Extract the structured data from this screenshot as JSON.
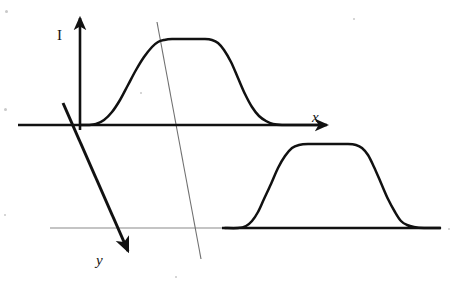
{
  "figure": {
    "background_color": "#ffffff",
    "stroke_color": "#111111",
    "thin_line_color": "#8a8a8a",
    "width": 456,
    "height": 292,
    "labels": {
      "vertical_axis": "I",
      "horizontal_axis": "x",
      "oblique_axis": "y"
    }
  },
  "chart_data": {
    "type": "line",
    "title": "",
    "xlabel": "x",
    "ylabel": "I",
    "grid": false,
    "legend": null,
    "annotations": [
      {
        "name": "vertical-axis-label",
        "text": "I",
        "x": 63,
        "y": 35
      },
      {
        "name": "horizontal-axis-label",
        "text": "x",
        "x": 317,
        "y": 117
      },
      {
        "name": "oblique-axis-label",
        "text": "y",
        "x": 101,
        "y": 261
      }
    ],
    "axes": [
      {
        "name": "vertical-axis-I",
        "label": "I",
        "from": [
          80,
          130
        ],
        "to": [
          80,
          12
        ],
        "arrow": "end",
        "weight": "thick"
      },
      {
        "name": "horizontal-axis-x",
        "label": "x",
        "from": [
          18,
          125
        ],
        "to": [
          332,
          125
        ],
        "arrow": "end",
        "weight": "thick"
      },
      {
        "name": "oblique-axis-y",
        "label": "y",
        "from": [
          63,
          103
        ],
        "to": [
          131,
          258
        ],
        "arrow": "end",
        "weight": "thick"
      },
      {
        "name": "secondary-baseline",
        "label": "",
        "from": [
          50,
          228
        ],
        "to": [
          222,
          228
        ],
        "arrow": "none",
        "weight": "thin"
      },
      {
        "name": "oblique-guide-line",
        "label": "",
        "from": [
          157,
          22
        ],
        "to": [
          201,
          259
        ],
        "arrow": "none",
        "weight": "thin"
      }
    ],
    "series": [
      {
        "name": "upper-trapezoid-profile",
        "baseline_y": 125,
        "plateau_y": 40,
        "points": [
          [
            80,
            125
          ],
          [
            88,
            125
          ],
          [
            96,
            124
          ],
          [
            104,
            120
          ],
          [
            112,
            112
          ],
          [
            120,
            100
          ],
          [
            128,
            85
          ],
          [
            136,
            70
          ],
          [
            144,
            57
          ],
          [
            152,
            47
          ],
          [
            158,
            42
          ],
          [
            164,
            40
          ],
          [
            172,
            39
          ],
          [
            190,
            39
          ],
          [
            205,
            39
          ],
          [
            212,
            40
          ],
          [
            218,
            43
          ],
          [
            224,
            50
          ],
          [
            231,
            62
          ],
          [
            238,
            78
          ],
          [
            245,
            94
          ],
          [
            252,
            107
          ],
          [
            259,
            116
          ],
          [
            266,
            121
          ],
          [
            273,
            124
          ],
          [
            282,
            125
          ],
          [
            300,
            125
          ],
          [
            320,
            125
          ]
        ]
      },
      {
        "name": "lower-trapezoid-profile",
        "baseline_y": 228,
        "plateau_y": 145,
        "points": [
          [
            225,
            228
          ],
          [
            238,
            228
          ],
          [
            246,
            226
          ],
          [
            252,
            221
          ],
          [
            258,
            212
          ],
          [
            264,
            199
          ],
          [
            271,
            184
          ],
          [
            278,
            168
          ],
          [
            285,
            156
          ],
          [
            292,
            148
          ],
          [
            299,
            145
          ],
          [
            308,
            144
          ],
          [
            330,
            144
          ],
          [
            348,
            144
          ],
          [
            356,
            145
          ],
          [
            362,
            148
          ],
          [
            368,
            155
          ],
          [
            374,
            167
          ],
          [
            381,
            183
          ],
          [
            388,
            199
          ],
          [
            395,
            212
          ],
          [
            401,
            221
          ],
          [
            407,
            225
          ],
          [
            414,
            227
          ],
          [
            424,
            228
          ],
          [
            440,
            228
          ]
        ]
      }
    ]
  },
  "specks": [
    {
      "x": 5,
      "y": 10,
      "size": 3
    },
    {
      "x": 4,
      "y": 108,
      "size": 3
    },
    {
      "x": 353,
      "y": 18,
      "size": 2
    },
    {
      "x": 140,
      "y": 92,
      "size": 2
    },
    {
      "x": 4,
      "y": 214,
      "size": 2
    },
    {
      "x": 175,
      "y": 276,
      "size": 2
    },
    {
      "x": 448,
      "y": 228,
      "size": 2
    }
  ]
}
